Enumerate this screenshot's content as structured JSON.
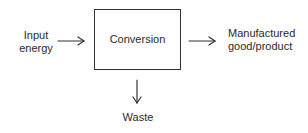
{
  "diagram": {
    "type": "process-flow",
    "nodes": {
      "input": {
        "label_line1": "Input",
        "label_line2": "energy"
      },
      "process": {
        "label": "Conversion"
      },
      "output": {
        "label_line1": "Manufactured",
        "label_line2": "good/product"
      },
      "byproduct": {
        "label": "Waste"
      }
    },
    "edges": [
      {
        "from": "input",
        "to": "process",
        "direction": "right"
      },
      {
        "from": "process",
        "to": "output",
        "direction": "right"
      },
      {
        "from": "process",
        "to": "byproduct",
        "direction": "down"
      }
    ],
    "colors": {
      "stroke": "#333333",
      "text": "#2a2a2a",
      "background": "#ffffff"
    }
  }
}
